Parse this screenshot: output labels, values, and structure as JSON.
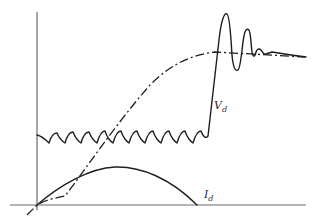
{
  "figure": {
    "type": "waveform-diagram",
    "curves": [
      {
        "id": "vd",
        "label": "V",
        "subscript": "d",
        "style": "solid",
        "description": "sawtooth ripple, rising step then damped oscillation settling to steady value"
      },
      {
        "id": "id",
        "label": "I",
        "subscript": "d",
        "style": "solid",
        "description": "arch-shaped current pulse returning to zero"
      },
      {
        "id": "ramp",
        "label": "",
        "style": "dash-dot",
        "description": "rising ramp saturating to steady level"
      }
    ]
  },
  "labels": {
    "vd_main": "V",
    "vd_sub": "d",
    "id_main": "I",
    "id_sub": "d"
  },
  "colors": {
    "line": "#1e1e1e",
    "axis": "#6b6b6b",
    "background": "#ffffff"
  }
}
